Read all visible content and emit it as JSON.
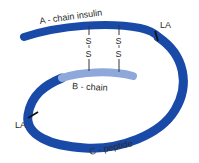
{
  "diagram": {
    "labels": {
      "a_chain": "A - chain insulin",
      "b_chain": "B - chain",
      "c_peptide": "C - peptide",
      "la_top": "LA",
      "la_left": "LA"
    },
    "bonds": [
      {
        "top": "S",
        "bottom": "S"
      },
      {
        "top": "S",
        "bottom": "S"
      }
    ],
    "colors": {
      "a_chain": "#1a4aa8",
      "c_peptide": "#1a4aa8",
      "b_chain": "#8fa8dc",
      "bond_line": "#333333",
      "la_marker": "#111111"
    }
  }
}
